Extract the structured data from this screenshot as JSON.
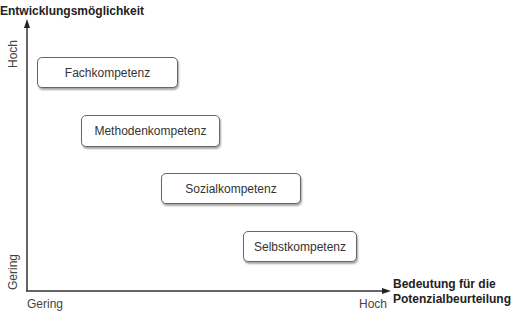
{
  "axes": {
    "y_title": "Entwicklungsmöglichkeit",
    "x_title_line1": "Bedeutung für die",
    "x_title_line2": "Potenzialbeurteilung",
    "y_high": "Hoch",
    "y_low": "Gering",
    "x_low": "Gering",
    "x_high": "Hoch"
  },
  "boxes": [
    {
      "label": "Fachkompetenz"
    },
    {
      "label": "Methodenkompetenz"
    },
    {
      "label": "Sozialkompetenz"
    },
    {
      "label": "Selbstkompetenz"
    }
  ],
  "colors": {
    "axis": "#333333",
    "box_border": "#666666"
  }
}
